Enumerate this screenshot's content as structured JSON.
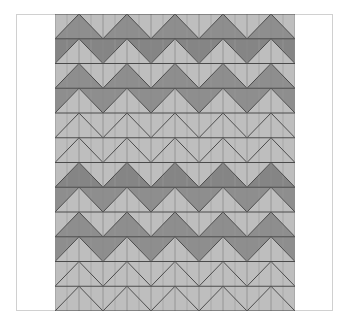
{
  "figure": {
    "type": "chevron-quilt-pattern",
    "frame": {
      "x": 16,
      "y": 14,
      "width": 317,
      "height": 297,
      "stroke": "#d0d0d0"
    },
    "grid": {
      "x": 55,
      "y": 14,
      "cols": 10,
      "rows": 12,
      "cell_width": 24,
      "cell_height": 24.75
    },
    "colors": {
      "light": "#bebebe",
      "dark": "#8e8e8e",
      "dark_strong": "#858585",
      "line": "#4a4a4a",
      "center_line": "#9a9a9a"
    },
    "rows": [
      {
        "index": 0,
        "dark": "lower",
        "tone": "dark"
      },
      {
        "index": 1,
        "dark": "upper",
        "tone": "dark_strong"
      },
      {
        "index": 2,
        "dark": "lower",
        "tone": "dark"
      },
      {
        "index": 3,
        "dark": "upper",
        "tone": "dark"
      },
      {
        "index": 4,
        "dark": "none",
        "tone": "light"
      },
      {
        "index": 5,
        "dark": "none",
        "tone": "light"
      },
      {
        "index": 6,
        "dark": "lower",
        "tone": "dark_strong"
      },
      {
        "index": 7,
        "dark": "upper",
        "tone": "dark"
      },
      {
        "index": 8,
        "dark": "lower",
        "tone": "dark"
      },
      {
        "index": 9,
        "dark": "upper",
        "tone": "dark"
      },
      {
        "index": 10,
        "dark": "none",
        "tone": "light"
      },
      {
        "index": 11,
        "dark": "none",
        "tone": "light"
      }
    ]
  }
}
